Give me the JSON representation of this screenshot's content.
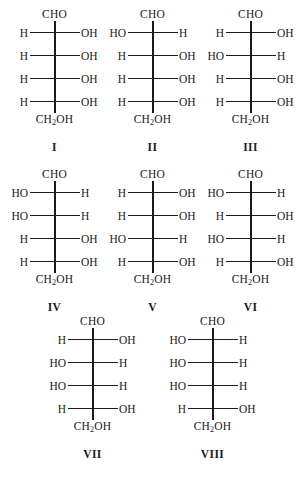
{
  "figure": {
    "type": "chemical-structure-figure",
    "background_color": "#ffffff",
    "line_color": "#1a1a1a",
    "top_group": "CHO",
    "bottom_group_prefix": "CH",
    "bottom_group_subscript": "2",
    "bottom_group_suffix": "OH"
  },
  "rows": [
    {
      "molecules": [
        {
          "label": "I",
          "top": "CHO",
          "bottom_prefix": "CH",
          "bottom_sub": "2",
          "bottom_suffix": "OH",
          "centers": [
            {
              "left": "H",
              "right": "OH"
            },
            {
              "left": "H",
              "right": "OH"
            },
            {
              "left": "H",
              "right": "OH"
            },
            {
              "left": "H",
              "right": "OH"
            }
          ]
        },
        {
          "label": "II",
          "top": "CHO",
          "bottom_prefix": "CH",
          "bottom_sub": "2",
          "bottom_suffix": "OH",
          "centers": [
            {
              "left": "HO",
              "right": "H"
            },
            {
              "left": "H",
              "right": "OH"
            },
            {
              "left": "H",
              "right": "OH"
            },
            {
              "left": "H",
              "right": "OH"
            }
          ]
        },
        {
          "label": "III",
          "top": "CHO",
          "bottom_prefix": "CH",
          "bottom_sub": "2",
          "bottom_suffix": "OH",
          "centers": [
            {
              "left": "H",
              "right": "OH"
            },
            {
              "left": "HO",
              "right": "H"
            },
            {
              "left": "H",
              "right": "OH"
            },
            {
              "left": "H",
              "right": "OH"
            }
          ]
        }
      ]
    },
    {
      "molecules": [
        {
          "label": "IV",
          "top": "CHO",
          "bottom_prefix": "CH",
          "bottom_sub": "2",
          "bottom_suffix": "OH",
          "centers": [
            {
              "left": "HO",
              "right": "H"
            },
            {
              "left": "HO",
              "right": "H"
            },
            {
              "left": "H",
              "right": "OH"
            },
            {
              "left": "H",
              "right": "OH"
            }
          ]
        },
        {
          "label": "V",
          "top": "CHO",
          "bottom_prefix": "CH",
          "bottom_sub": "2",
          "bottom_suffix": "OH",
          "centers": [
            {
              "left": "H",
              "right": "OH"
            },
            {
              "left": "H",
              "right": "OH"
            },
            {
              "left": "HO",
              "right": "H"
            },
            {
              "left": "H",
              "right": "OH"
            }
          ]
        },
        {
          "label": "VI",
          "top": "CHO",
          "bottom_prefix": "CH",
          "bottom_sub": "2",
          "bottom_suffix": "OH",
          "centers": [
            {
              "left": "HO",
              "right": "H"
            },
            {
              "left": "H",
              "right": "OH"
            },
            {
              "left": "HO",
              "right": "H"
            },
            {
              "left": "H",
              "right": "OH"
            }
          ]
        }
      ]
    },
    {
      "molecules": [
        {
          "label": "VII",
          "top": "CHO",
          "bottom_prefix": "CH",
          "bottom_sub": "2",
          "bottom_suffix": "OH",
          "centers": [
            {
              "left": "H",
              "right": "OH"
            },
            {
              "left": "HO",
              "right": "H"
            },
            {
              "left": "HO",
              "right": "H"
            },
            {
              "left": "H",
              "right": "OH"
            }
          ]
        },
        {
          "label": "VIII",
          "top": "CHO",
          "bottom_prefix": "CH",
          "bottom_sub": "2",
          "bottom_suffix": "OH",
          "centers": [
            {
              "left": "HO",
              "right": "H"
            },
            {
              "left": "HO",
              "right": "H"
            },
            {
              "left": "HO",
              "right": "H"
            },
            {
              "left": "H",
              "right": "OH"
            }
          ]
        }
      ]
    }
  ]
}
